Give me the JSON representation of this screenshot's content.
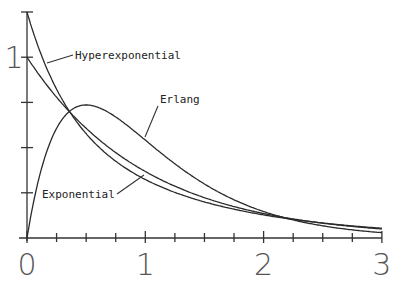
{
  "chart_data": {
    "type": "line",
    "title": "",
    "xlabel": "",
    "ylabel": "",
    "xlim": [
      0,
      3
    ],
    "ylim": [
      0,
      1.25
    ],
    "grid": false,
    "x_ticks": [
      0,
      0.25,
      0.5,
      0.75,
      1,
      1.25,
      1.5,
      1.75,
      2,
      2.25,
      2.5,
      2.75,
      3
    ],
    "x_tick_labels": [
      {
        "value": 0,
        "label": "0"
      },
      {
        "value": 1,
        "label": "1"
      },
      {
        "value": 2,
        "label": "2"
      },
      {
        "value": 3,
        "label": "3"
      }
    ],
    "y_ticks": [
      0,
      0.25,
      0.5,
      0.75,
      1,
      1.25
    ],
    "y_tick_labels": [
      {
        "value": 1,
        "label": "1"
      }
    ],
    "x": [
      0,
      0.1,
      0.2,
      0.3,
      0.4,
      0.5,
      0.6,
      0.7,
      0.8,
      0.9,
      1.0,
      1.2,
      1.4,
      1.6,
      1.8,
      2.0,
      2.2,
      2.4,
      2.6,
      2.8,
      3.0
    ],
    "series": [
      {
        "name": "Exponential",
        "values": [
          1.0,
          0.905,
          0.819,
          0.741,
          0.67,
          0.607,
          0.549,
          0.497,
          0.449,
          0.407,
          0.368,
          0.301,
          0.247,
          0.202,
          0.165,
          0.135,
          0.111,
          0.091,
          0.074,
          0.061,
          0.05
        ]
      },
      {
        "name": "Hyperexponential",
        "values": [
          1.25,
          1.087,
          0.955,
          0.846,
          0.756,
          0.681,
          0.617,
          0.562,
          0.514,
          0.473,
          0.436,
          0.373,
          0.322,
          0.278,
          0.241,
          0.209,
          0.181,
          0.157,
          0.137,
          0.119,
          0.103
        ]
      },
      {
        "name": "Erlang",
        "values": [
          0.0,
          0.327,
          0.536,
          0.659,
          0.719,
          0.736,
          0.723,
          0.69,
          0.646,
          0.595,
          0.541,
          0.435,
          0.342,
          0.261,
          0.197,
          0.147,
          0.108,
          0.079,
          0.057,
          0.041,
          0.03
        ]
      }
    ],
    "annotations": [
      {
        "text": "Hyperexponential",
        "x": 0.4,
        "y": 1.0
      },
      {
        "text": "Erlang",
        "x": 1.1,
        "y": 0.78
      },
      {
        "text": "Exponential",
        "x": 0.13,
        "y": 0.25
      }
    ],
    "legend": "none (inline labels with leader lines)"
  }
}
